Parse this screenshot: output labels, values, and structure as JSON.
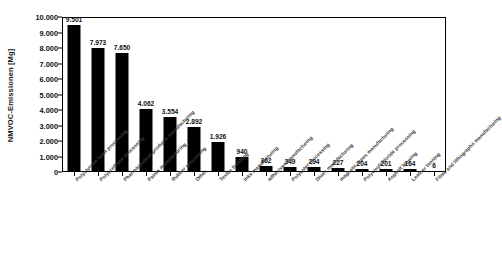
{
  "chart_data": {
    "type": "bar",
    "title": "",
    "xlabel": "",
    "ylabel": "NMVOC-Emissionen [Mg]",
    "ylim": [
      0,
      10000
    ],
    "grid": false,
    "legend": "none",
    "orientation": "vertical",
    "bar_color": "#000000",
    "y_tick_labels": [
      "10.000",
      "9.000",
      "8.000",
      "7.000",
      "6.000",
      "5.000",
      "4.000",
      "3.000",
      "2.000",
      "1.000",
      "0"
    ],
    "y_tick_values": [
      10000,
      9000,
      8000,
      7000,
      6000,
      5000,
      4000,
      3000,
      2000,
      1000,
      0
    ],
    "categories": [
      "Polystyrene foam processing",
      "Polyurethane processing",
      "Pharmaceutical products manufacturing",
      "Paints manufacturing",
      "Rubber processing",
      "Other",
      "Textile finishing",
      "Inks manufacturing",
      "adhesives manufacturing",
      "Polyester processing",
      "Glues manufacturing",
      "magnetic tapes manufacturing",
      "Polyvinylchloride processing",
      "Asphalt blowing",
      "Leather tanning",
      "Films and lithographs manufacturing"
    ],
    "values": [
      9501,
      7973,
      7650,
      4062,
      3554,
      2892,
      1926,
      940,
      362,
      349,
      294,
      227,
      204,
      201,
      164,
      6
    ],
    "value_labels": [
      "9.501",
      "7.973",
      "7.650",
      "4.062",
      "3.554",
      "2.892",
      "1.926",
      "940",
      "362",
      "349",
      "294",
      "227",
      "204",
      "201",
      "164",
      "6"
    ]
  }
}
